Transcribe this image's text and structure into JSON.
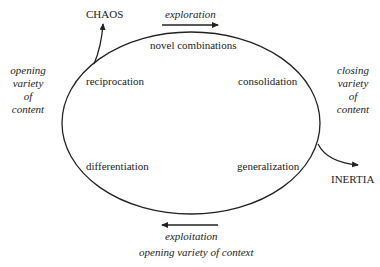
{
  "diagram": {
    "type": "cycle",
    "stroke_color": "#222222",
    "background": "#ffffff",
    "cycle_stages": [
      {
        "label": "novel combinations",
        "position": "top"
      },
      {
        "label": "consolidation",
        "position": "upper-right"
      },
      {
        "label": "generalization",
        "position": "lower-right"
      },
      {
        "label": "differentiation",
        "position": "lower-left"
      },
      {
        "label": "reciprocation",
        "position": "upper-left"
      }
    ],
    "exits": {
      "chaos": "CHAOS",
      "inertia": "INERTIA"
    },
    "flows": {
      "top_arrow_label": "exploration",
      "bottom_arrow_label": "exploitation",
      "bottom_caption": "opening variety of context"
    },
    "side_labels": {
      "left": [
        "opening",
        "variety",
        "of",
        "content"
      ],
      "right": [
        "closing",
        "variety",
        "of",
        "content"
      ]
    }
  }
}
